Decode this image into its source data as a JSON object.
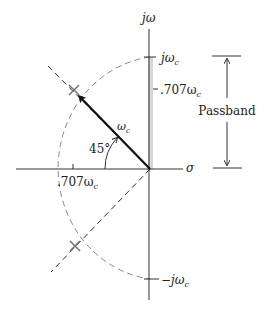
{
  "diagram": {
    "type": "s-plane pole-zero plot",
    "axes": {
      "vertical_label": "jω",
      "horizontal_label": "σ"
    },
    "imag_axis_labels": {
      "top": "jω",
      "top_sub": "c",
      "mid": ".707ω",
      "mid_sub": "c",
      "bottom": "−jω",
      "bottom_sub": "c"
    },
    "real_axis_label": {
      "text": ".707ω",
      "sub": "c"
    },
    "vector_label": {
      "text": "ω",
      "sub": "c"
    },
    "angle_label": "45°",
    "passband_label": "Passband",
    "poles": [
      {
        "name": "upper-pole",
        "x": 74,
        "y": 90
      },
      {
        "name": "lower-pole",
        "x": 75,
        "y": 246
      }
    ],
    "colors": {
      "axis": "#333333",
      "dashed": "#888888",
      "passband_strip": "#d8d8d8",
      "pole": "#777777",
      "vector": "#111111"
    }
  }
}
